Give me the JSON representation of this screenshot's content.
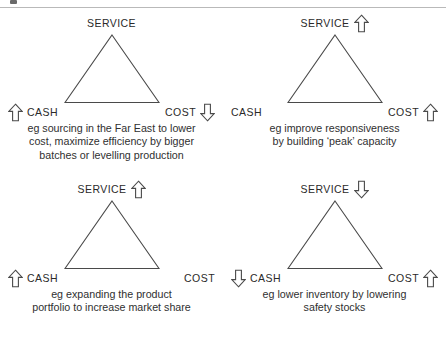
{
  "figure": {
    "type": "service-cost-cash trade-off triangles",
    "top_rule_visible": true,
    "colors": {
      "stroke": "#4a4a4a",
      "text": "#2a2a2a",
      "background": "#ffffff"
    }
  },
  "panels": [
    {
      "id": "panel-1",
      "vertices": {
        "service": {
          "label": "SERVICE",
          "arrow": "none",
          "arrow_side": "right"
        },
        "cash": {
          "label": "CASH",
          "arrow": "up",
          "arrow_side": "left"
        },
        "cost": {
          "label": "COST",
          "arrow": "down",
          "arrow_side": "right"
        }
      },
      "caption": [
        "eg sourcing in the Far East to lower",
        "cost, maximize efficiency by bigger",
        "batches or levelling production"
      ]
    },
    {
      "id": "panel-2",
      "vertices": {
        "service": {
          "label": "SERVICE",
          "arrow": "up",
          "arrow_side": "right"
        },
        "cash": {
          "label": "CASH",
          "arrow": "none",
          "arrow_side": "left"
        },
        "cost": {
          "label": "COST",
          "arrow": "up",
          "arrow_side": "right"
        }
      },
      "caption": [
        "eg improve responsiveness",
        "by building ‘peak’ capacity"
      ]
    },
    {
      "id": "panel-3",
      "vertices": {
        "service": {
          "label": "SERVICE",
          "arrow": "up",
          "arrow_side": "right"
        },
        "cash": {
          "label": "CASH",
          "arrow": "up",
          "arrow_side": "left"
        },
        "cost": {
          "label": "COST",
          "arrow": "none",
          "arrow_side": "right"
        }
      },
      "caption": [
        "eg expanding the product",
        "portfolio to increase market share"
      ]
    },
    {
      "id": "panel-4",
      "vertices": {
        "service": {
          "label": "SERVICE",
          "arrow": "down",
          "arrow_side": "right"
        },
        "cash": {
          "label": "CASH",
          "arrow": "down",
          "arrow_side": "left"
        },
        "cost": {
          "label": "COST",
          "arrow": "up",
          "arrow_side": "right"
        }
      },
      "caption": [
        "eg lower inventory by lowering",
        "safety stocks"
      ]
    }
  ]
}
